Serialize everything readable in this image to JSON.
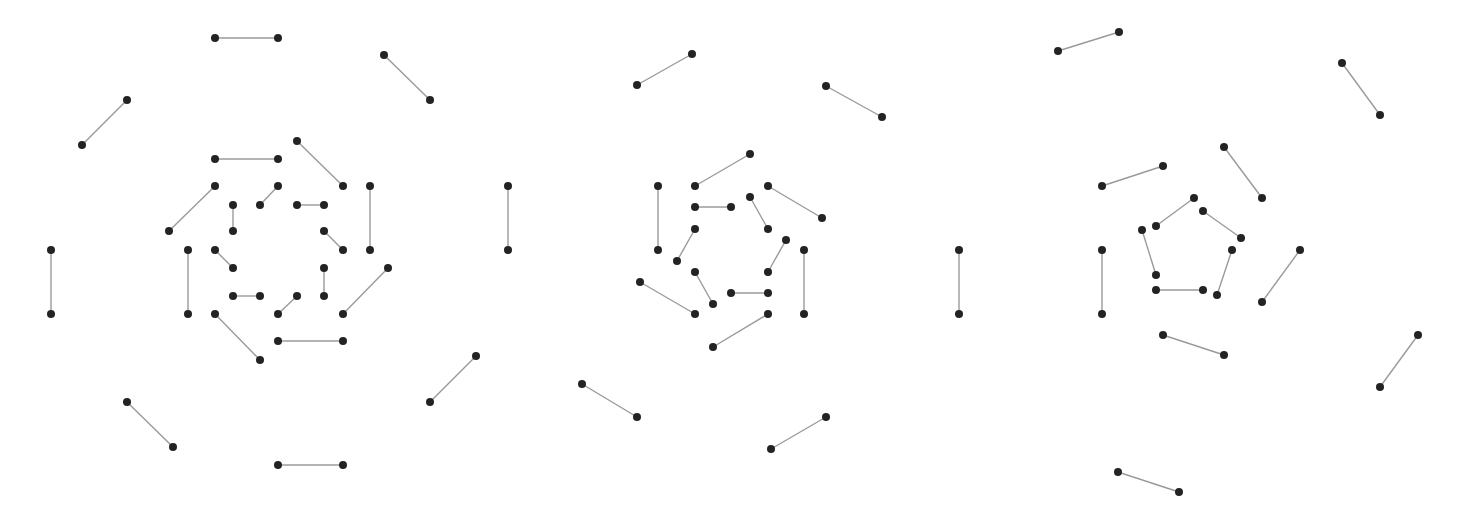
{
  "style": {
    "background": "#ffffff",
    "edge_color": "#9a9a9a",
    "node_color": "#232323",
    "node_radius": 4
  },
  "figures": [
    {
      "id": "figure-1",
      "description": "Perfect matching drawn as three concentric octagonal rings of 8 edges each",
      "edges": [
        [
          215,
          38,
          278,
          38
        ],
        [
          384,
          55,
          430,
          100
        ],
        [
          127,
          100,
          82,
          145
        ],
        [
          508,
          186,
          508,
          250
        ],
        [
          51,
          250,
          51,
          314
        ],
        [
          430,
          402,
          476,
          356
        ],
        [
          127,
          402,
          173,
          447
        ],
        [
          278,
          465,
          343,
          465
        ],
        [
          215,
          159,
          278,
          159
        ],
        [
          297,
          141,
          343,
          186
        ],
        [
          215,
          186,
          169,
          231
        ],
        [
          370,
          186,
          370,
          250
        ],
        [
          188,
          250,
          188,
          314
        ],
        [
          343,
          314,
          388,
          268
        ],
        [
          215,
          314,
          260,
          360
        ],
        [
          278,
          341,
          343,
          341
        ],
        [
          278,
          186,
          260,
          205
        ],
        [
          233,
          205,
          233,
          231
        ],
        [
          297,
          205,
          324,
          205
        ],
        [
          324,
          231,
          343,
          250
        ],
        [
          215,
          250,
          233,
          268
        ],
        [
          233,
          296,
          260,
          296
        ],
        [
          297,
          296,
          278,
          314
        ],
        [
          324,
          268,
          324,
          296
        ]
      ]
    },
    {
      "id": "figure-2",
      "description": "Perfect matching drawn as three concentric hexagonal rings (5/6/6 edges)",
      "edges": [
        [
          637,
          85,
          692,
          54
        ],
        [
          826,
          86,
          882,
          117
        ],
        [
          959,
          250,
          959,
          314
        ],
        [
          582,
          384,
          637,
          417
        ],
        [
          771,
          449,
          826,
          417
        ],
        [
          695,
          186,
          750,
          154
        ],
        [
          768,
          186,
          822,
          218
        ],
        [
          658,
          186,
          658,
          250
        ],
        [
          640,
          282,
          695,
          314
        ],
        [
          713,
          347,
          768,
          314
        ],
        [
          804,
          250,
          804,
          314
        ],
        [
          695,
          207,
          731,
          207
        ],
        [
          750,
          197,
          768,
          229
        ],
        [
          695,
          229,
          677,
          261
        ],
        [
          786,
          240,
          768,
          272
        ],
        [
          695,
          272,
          713,
          304
        ],
        [
          731,
          293,
          768,
          293
        ]
      ]
    },
    {
      "id": "figure-3",
      "description": "Perfect matching drawn as three concentric pentagonal rings of 5, 4 and 5 edges",
      "edges": [
        [
          1058,
          51,
          1119,
          32
        ],
        [
          1342,
          63,
          1380,
          115
        ],
        [
          1102,
          250,
          1102,
          314
        ],
        [
          1418,
          335,
          1380,
          387
        ],
        [
          1118,
          472,
          1179,
          492
        ],
        [
          1102,
          186,
          1163,
          166
        ],
        [
          1224,
          147,
          1262,
          198
        ],
        [
          1300,
          250,
          1262,
          302
        ],
        [
          1163,
          335,
          1224,
          355
        ],
        [
          1156,
          226,
          1194,
          198
        ],
        [
          1203,
          211,
          1241,
          238
        ],
        [
          1232,
          250,
          1217,
          295
        ],
        [
          1156,
          290,
          1203,
          290
        ],
        [
          1142,
          230,
          1156,
          275
        ]
      ]
    }
  ]
}
